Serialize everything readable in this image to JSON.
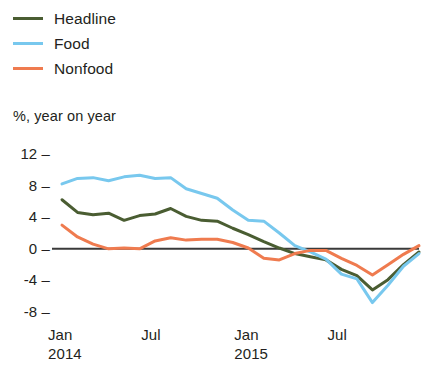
{
  "chart_data": {
    "type": "line",
    "title": "",
    "subtitle": "",
    "xlabel": "",
    "ylabel": "%, year on year",
    "ylim": [
      -9,
      13
    ],
    "yticks": [
      12,
      8,
      4,
      0,
      -4,
      -8
    ],
    "ytick_labels": [
      "12",
      "8",
      "4",
      "0",
      "-4",
      "-8"
    ],
    "grid": false,
    "zero_line": true,
    "legend_position": "top-left",
    "x": [
      "Jan 2014",
      "Feb 2014",
      "Mar 2014",
      "Apr 2014",
      "May 2014",
      "Jun 2014",
      "Jul 2014",
      "Aug 2014",
      "Sep 2014",
      "Oct 2014",
      "Nov 2014",
      "Dec 2014",
      "Jan 2015",
      "Feb 2015",
      "Mar 2015",
      "Apr 2015",
      "May 2015",
      "Jun 2015",
      "Jul 2015",
      "Aug 2015",
      "Sep 2015",
      "Oct 2015",
      "Nov 2015",
      "Dec 2015"
    ],
    "xticks": [
      "Jan",
      "Jul",
      "Jan",
      "Jul"
    ],
    "xtick_years": [
      "2014",
      "",
      "2015",
      ""
    ],
    "xtick_index": [
      0,
      6,
      12,
      18
    ],
    "series": [
      {
        "name": "Headline",
        "color": "#4a5d32",
        "values": [
          6.2,
          4.6,
          4.3,
          4.5,
          3.6,
          4.2,
          4.4,
          5.1,
          4.1,
          3.6,
          3.5,
          2.6,
          1.8,
          0.9,
          0.1,
          -0.6,
          -1.0,
          -1.4,
          -2.6,
          -3.4,
          -5.2,
          -3.9,
          -2.0,
          -0.4
        ]
      },
      {
        "name": "Food",
        "color": "#78c8ee",
        "values": [
          8.2,
          8.9,
          9.0,
          8.6,
          9.1,
          9.3,
          8.9,
          9.0,
          7.6,
          7.0,
          6.4,
          4.9,
          3.6,
          3.5,
          2.0,
          0.4,
          -0.4,
          -1.3,
          -3.2,
          -3.8,
          -6.8,
          -4.6,
          -2.2,
          -0.6
        ]
      },
      {
        "name": "Nonfood",
        "color": "#ef7b4f",
        "values": [
          3.0,
          1.5,
          0.6,
          0.0,
          0.1,
          0.0,
          1.0,
          1.4,
          1.1,
          1.2,
          1.2,
          0.8,
          0.1,
          -1.2,
          -1.4,
          -0.6,
          -0.2,
          -0.2,
          -1.2,
          -2.1,
          -3.3,
          -2.0,
          -0.7,
          0.4
        ]
      }
    ]
  },
  "legend": {
    "items": [
      {
        "label": "Headline",
        "color": "#4a5d32"
      },
      {
        "label": "Food",
        "color": "#78c8ee"
      },
      {
        "label": "Nonfood",
        "color": "#ef7b4f"
      }
    ]
  },
  "axis": {
    "unit_label": "%, year on year"
  }
}
